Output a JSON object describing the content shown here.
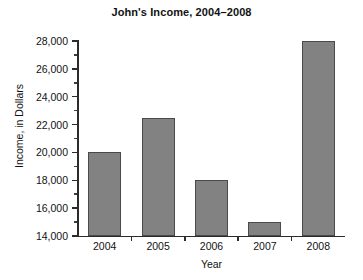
{
  "chart_data": {
    "type": "bar",
    "title": "John's Income, 2004–2008",
    "xlabel": "Year",
    "ylabel": "Income, in Dollars",
    "categories": [
      "2004",
      "2005",
      "2006",
      "2007",
      "2008"
    ],
    "values": [
      20000,
      22500,
      18000,
      15000,
      28000
    ],
    "ylim": [
      14000,
      28000
    ],
    "ytick_values": [
      14000,
      16000,
      18000,
      20000,
      22000,
      24000,
      26000,
      28000
    ],
    "ytick_labels": [
      "14,000",
      "16,000",
      "18,000",
      "20,000",
      "22,000",
      "24,000",
      "26,000",
      "28,000"
    ],
    "yminor_values": [
      15000,
      17000,
      19000,
      21000,
      23000,
      25000,
      27000
    ],
    "grid": false,
    "legend": false,
    "legend_position": "none",
    "bar_color": "#828282",
    "bar_edge_color": "#4a4a4a",
    "axis_color": "#2b2b2b",
    "background_color": "#ffffff",
    "text_color": "#121212"
  }
}
